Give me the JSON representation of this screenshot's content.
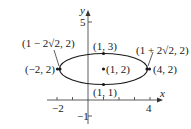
{
  "diagram": {
    "type": "ellipse-graph",
    "axes": {
      "x_label": "x",
      "y_label": "y",
      "x_tick_labels": [
        "−2",
        "4"
      ],
      "y_tick_labels": [
        "5",
        "−1"
      ]
    },
    "ellipse": {
      "center": [
        1,
        2
      ],
      "semi_major": 2.828,
      "semi_minor": 1
    },
    "points": [
      {
        "id": "center",
        "label": "(1, 2)"
      },
      {
        "id": "top",
        "label": "(1, 3)"
      },
      {
        "id": "bottom",
        "label": "(1, 1)"
      },
      {
        "id": "left-vertex",
        "label": "(−2, 2)"
      },
      {
        "id": "right-vertex",
        "label": "(4, 2)"
      },
      {
        "id": "left-focus-annotation",
        "label": "(1 − 2√2, 2)"
      },
      {
        "id": "right-focus-annotation",
        "label": "(1 + 2√2, 2)"
      }
    ],
    "colors": {
      "stroke": "#1a1a1a",
      "background": "#ffffff"
    }
  }
}
